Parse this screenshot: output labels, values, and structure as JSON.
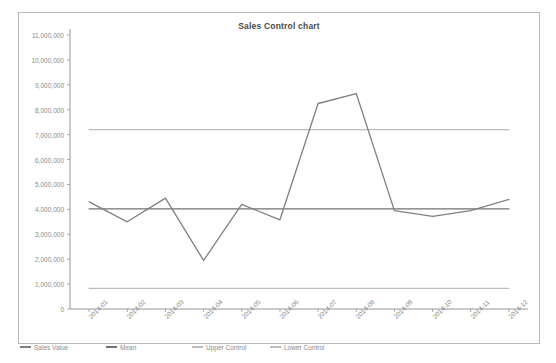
{
  "chart_data": {
    "type": "line",
    "title": "Sales Control chart",
    "xlabel": "",
    "ylabel": "",
    "grid": false,
    "legend_position": "bottom-left",
    "categories": [
      "2014-01",
      "2014-02",
      "2014-03",
      "2014-04",
      "2014-05",
      "2014-06",
      "2014-07",
      "2014-08",
      "2014-09",
      "2014-10",
      "2014-11",
      "2014-12"
    ],
    "ylim": [
      0,
      11000000
    ],
    "ytick_labels": [
      "0",
      "1,000,000",
      "2,000,000",
      "3,000,000",
      "4,000,000",
      "5,000,000",
      "6,000,000",
      "7,000,000",
      "8,000,000",
      "9,000,000",
      "10,000,000",
      "11,000,000"
    ],
    "ytick_values": [
      0,
      1000000,
      2000000,
      3000000,
      4000000,
      5000000,
      6000000,
      7000000,
      8000000,
      9000000,
      10000000,
      11000000
    ],
    "series": [
      {
        "name": "Sales Value",
        "color": "#808080",
        "values": [
          4300000,
          3500000,
          4450000,
          1950000,
          4200000,
          3580000,
          8250000,
          8650000,
          3950000,
          3720000,
          3950000,
          4400000
        ]
      },
      {
        "name": "Mean",
        "color": "#737373",
        "constant": 4020000,
        "values": [
          4020000,
          4020000,
          4020000,
          4020000,
          4020000,
          4020000,
          4020000,
          4020000,
          4020000,
          4020000,
          4020000,
          4020000
        ]
      },
      {
        "name": "Upper Control",
        "color": "#bcbcbc",
        "constant": 7200000,
        "values": [
          7200000,
          7200000,
          7200000,
          7200000,
          7200000,
          7200000,
          7200000,
          7200000,
          7200000,
          7200000,
          7200000,
          7200000
        ]
      },
      {
        "name": "Lower Control",
        "color": "#bcbcbc",
        "constant": 830000,
        "values": [
          830000,
          830000,
          830000,
          830000,
          830000,
          830000,
          830000,
          830000,
          830000,
          830000,
          830000,
          830000
        ]
      }
    ]
  },
  "colors": {
    "frame_border": "#b9b9b9",
    "axis": "#8a8a8a",
    "tick_text": "#8a8a8a",
    "title_text": "#4a4a4a",
    "background": "#ffffff"
  }
}
